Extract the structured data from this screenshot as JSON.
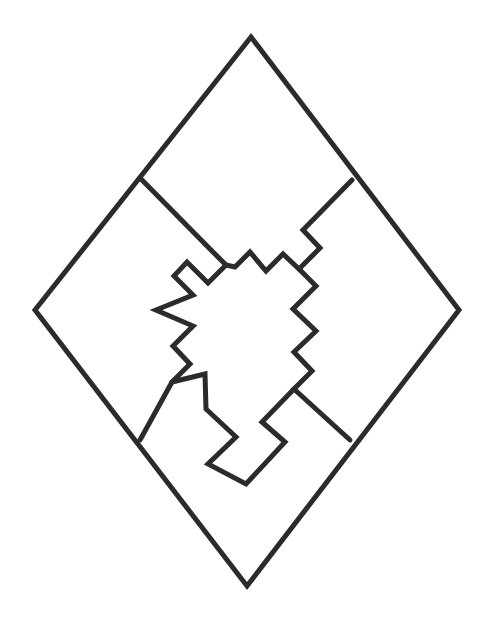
{
  "figure": {
    "background_color": "#ffffff",
    "stroke_color": "#2b2b2b",
    "stroke_width": 5,
    "canvas": {
      "width": 492,
      "height": 634
    }
  },
  "geometry": {
    "outer_diamond": {
      "name": "outer-diamond",
      "vertices": [
        {
          "label": "top",
          "x": 251,
          "y": 37
        },
        {
          "label": "right",
          "x": 459,
          "y": 310
        },
        {
          "label": "bottom",
          "x": 247,
          "y": 586
        },
        {
          "label": "left",
          "x": 35,
          "y": 310
        }
      ],
      "points": "251,37 459,310 247,586 35,310"
    },
    "seam_upper_left": {
      "name": "seam-upper-left",
      "description": "Zigzag seam running from the outer diamond's upper-left edge down to the central node",
      "points": "142,180 210,249 226,265 208,283 187,262 174,276 193,295 156,310 193,326 173,346 190,364 172,382 140,440"
    },
    "seam_upper_right": {
      "name": "seam-upper-right",
      "description": "Zigzag seam running from the outer diamond's upper-right edge down toward the central node",
      "points": "352,180 303,230 320,248 299,269 283,254 266,271 250,252 235,267 226,265"
    },
    "seam_right_vertical": {
      "name": "seam-right-zigzag",
      "description": "Vertical staircase zigzag on the right of the central form",
      "points": "299,269 316,286 293,309 316,331 294,352 312,371 294,389 350,440"
    },
    "seam_lower": {
      "name": "seam-lower-notch",
      "description": "Lower notched seam forming the bottom interlocking tab",
      "points": "172,382 205,374 206,409 236,437 208,464 246,484 285,442 262,422 294,389"
    },
    "nodes": [
      {
        "name": "node-upper-left-junction",
        "x": 142,
        "y": 180
      },
      {
        "name": "node-upper-right-junction",
        "x": 352,
        "y": 180
      },
      {
        "name": "node-lower-left-junction",
        "x": 140,
        "y": 440
      },
      {
        "name": "node-lower-right-junction",
        "x": 350,
        "y": 440
      },
      {
        "name": "node-center-top",
        "x": 226,
        "y": 265
      },
      {
        "name": "node-center-left",
        "x": 156,
        "y": 310
      },
      {
        "name": "node-center-right",
        "x": 294,
        "y": 389
      }
    ]
  }
}
